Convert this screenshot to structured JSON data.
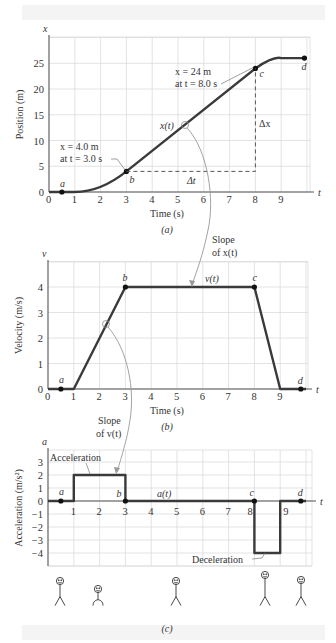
{
  "chart_data": [
    {
      "id": "a",
      "type": "line",
      "caption": "(a)",
      "xlabel": "Time (s)",
      "ylabel": "Position (m)",
      "x_axis_symbol": "t",
      "y_axis_symbol": "x",
      "xlim": [
        0,
        10
      ],
      "ylim": [
        0,
        30
      ],
      "xticks": [
        0,
        1,
        2,
        3,
        4,
        5,
        6,
        7,
        8,
        9
      ],
      "yticks": [
        0,
        5,
        10,
        15,
        20,
        25
      ],
      "grid": true,
      "series": [
        {
          "name": "x(t)",
          "x": [
            0,
            0.5,
            1,
            1.5,
            2,
            2.5,
            3,
            4,
            5,
            6,
            7,
            8,
            8.5,
            9,
            10
          ],
          "y": [
            0,
            0,
            0,
            0.25,
            1,
            2.25,
            4,
            8,
            12,
            16,
            20,
            24,
            25.5,
            26,
            26
          ]
        }
      ],
      "points": [
        {
          "label": "a",
          "x": 0.5,
          "y": 0
        },
        {
          "label": "b",
          "x": 3,
          "y": 4
        },
        {
          "label": "c",
          "x": 8,
          "y": 24
        },
        {
          "label": "d",
          "x": 9.9,
          "y": 26
        }
      ],
      "annotations": [
        {
          "text": "x = 4.0 m",
          "line2": "at t = 3.0 s",
          "target": "b"
        },
        {
          "text": "x = 24 m",
          "line2": "at t = 8.0 s",
          "target": "c"
        },
        {
          "text": "Δx",
          "kind": "rise"
        },
        {
          "text": "Δt",
          "kind": "run"
        },
        {
          "text": "x(t)",
          "kind": "curve-label"
        }
      ]
    },
    {
      "id": "b",
      "type": "line",
      "caption": "(b)",
      "xlabel": "Time (s)",
      "ylabel": "Velocity (m/s)",
      "x_axis_symbol": "t",
      "y_axis_symbol": "v",
      "xlim": [
        0,
        10
      ],
      "ylim": [
        0,
        5
      ],
      "xticks": [
        0,
        1,
        2,
        3,
        4,
        5,
        6,
        7,
        8,
        9
      ],
      "yticks": [
        0,
        1,
        2,
        3,
        4
      ],
      "grid": true,
      "series": [
        {
          "name": "v(t)",
          "x": [
            0,
            1,
            3,
            8,
            9,
            10
          ],
          "y": [
            0,
            0,
            4,
            4,
            0,
            0
          ]
        }
      ],
      "points": [
        {
          "label": "a",
          "x": 0.5,
          "y": 0
        },
        {
          "label": "b",
          "x": 3,
          "y": 4
        },
        {
          "label": "c",
          "x": 8,
          "y": 4
        },
        {
          "label": "d",
          "x": 9.8,
          "y": 0
        }
      ],
      "annotations": [
        {
          "text": "Slope",
          "line2": "of x(t)",
          "kind": "arrow-from-a"
        },
        {
          "text": "Slope",
          "line2": "of v(t)",
          "kind": "arrow-to-c"
        }
      ]
    },
    {
      "id": "c",
      "type": "line",
      "caption": "(c)",
      "xlabel": "",
      "ylabel": "Acceleration (m/s²)",
      "x_axis_symbol": "t",
      "y_axis_symbol": "a",
      "xlim": [
        0,
        10
      ],
      "ylim": [
        -5,
        4
      ],
      "xticks": [
        1,
        2,
        3,
        4,
        5,
        6,
        7,
        8,
        9
      ],
      "yticks": [
        3,
        2,
        1,
        0,
        -1,
        -2,
        -3,
        -4
      ],
      "grid": true,
      "series": [
        {
          "name": "a(t)",
          "x": [
            0,
            1,
            1,
            3,
            3,
            8,
            8,
            9,
            9,
            10
          ],
          "y": [
            0,
            0,
            2,
            2,
            0,
            0,
            -4,
            -4,
            0,
            0
          ]
        }
      ],
      "points": [
        {
          "label": "a",
          "x": 0.5,
          "y": 0
        },
        {
          "label": "b",
          "x": 3,
          "y": 0
        },
        {
          "label": "c",
          "x": 8,
          "y": 0
        },
        {
          "label": "d",
          "x": 9.8,
          "y": 0
        }
      ],
      "annotations": [
        {
          "text": "Acceleration",
          "kind": "box-label"
        },
        {
          "text": "Deceleration",
          "kind": "box-label"
        }
      ]
    }
  ],
  "labels": {
    "a_ann_b1": "x = 4.0 m",
    "a_ann_b2": "at t = 3.0 s",
    "a_ann_c1": "x = 24 m",
    "a_ann_c2": "at t = 8.0 s",
    "dx": "Δx",
    "dt": "Δt",
    "xt": "x(t)",
    "vt": "v(t)",
    "at": "a(t)",
    "slope_x_1": "Slope",
    "slope_x_2": "of x(t)",
    "slope_v_1": "Slope",
    "slope_v_2": "of v(t)",
    "accel": "Acceleration",
    "decel": "Deceleration"
  },
  "figures": {
    "count": 5,
    "description": "stick figures at positions a, b, mid, c, d"
  }
}
